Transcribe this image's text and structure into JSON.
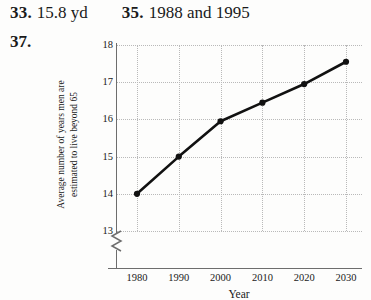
{
  "answers": [
    {
      "number": "33.",
      "text": "15.8 yd"
    },
    {
      "number": "35.",
      "text": "1988 and 1995"
    }
  ],
  "problem": {
    "number": "37."
  },
  "chart_data": {
    "type": "line",
    "title": "",
    "xlabel": "Year",
    "ylabel_line1": "Average number of years men are",
    "ylabel_line2": "estimated to live beyond 65",
    "categories": [
      1980,
      1990,
      2000,
      2010,
      2020,
      2030
    ],
    "xtick_labels": [
      "1980",
      "1990",
      "2000",
      "2010",
      "2020",
      "2030"
    ],
    "values": [
      14.0,
      15.0,
      15.95,
      16.45,
      16.95,
      17.55
    ],
    "ytick_labels": [
      "18",
      "17",
      "16",
      "15",
      "14",
      "13"
    ],
    "yticks": [
      18,
      17,
      16,
      15,
      14,
      13
    ],
    "ylim": [
      13,
      18
    ],
    "xlim": [
      1980,
      2030
    ],
    "axis_break": true,
    "grid": true,
    "legend": "none",
    "line_color": "#111111",
    "marker": "circle",
    "grid_color": "#b9b9b9"
  }
}
